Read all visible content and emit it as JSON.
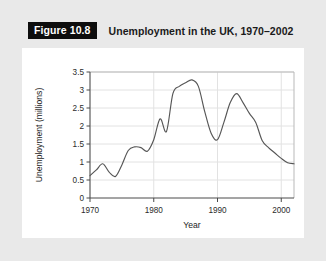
{
  "figure": {
    "badge_label": "Figure 10.8",
    "title": "Unemployment in the UK, 1970–2002"
  },
  "colors": {
    "page_background": "#e9e9e9",
    "card_background": "#ffffff",
    "badge_background": "#0d0d0d",
    "badge_text": "#ffffff",
    "title_text": "#1a1a1a",
    "line": "#565656",
    "axis": "#4a4a4a",
    "grid": "#e2e2e2",
    "frame": "#b9b9b9"
  },
  "chart_data": {
    "type": "line",
    "title": "Unemployment in the UK, 1970–2002",
    "xlabel": "Year",
    "ylabel": "Unemployment (millions)",
    "xlim": [
      1970,
      2002
    ],
    "ylim": [
      0,
      3.5
    ],
    "grid": true,
    "legend": "none",
    "xticks": [
      1970,
      1980,
      1990,
      2000
    ],
    "xtick_labels": [
      "1970",
      "1980",
      "1990",
      "2000"
    ],
    "yticks": [
      0,
      0.5,
      1,
      1.5,
      2,
      2.5,
      3,
      3.5
    ],
    "ytick_labels": [
      "0",
      "0.5",
      "1",
      "1.5",
      "2",
      "2.5",
      "3",
      "3.5"
    ],
    "series": [
      {
        "name": "Unemployment (millions)",
        "x": [
          1970,
          1971,
          1972,
          1973,
          1974,
          1975,
          1976,
          1977,
          1978,
          1979,
          1980,
          1981,
          1982,
          1983,
          1984,
          1985,
          1986,
          1987,
          1988,
          1989,
          1990,
          1991,
          1992,
          1993,
          1994,
          1995,
          1996,
          1997,
          1998,
          1999,
          2000,
          2001,
          2002
        ],
        "values": [
          0.62,
          0.78,
          0.95,
          0.72,
          0.6,
          0.92,
          1.32,
          1.42,
          1.4,
          1.3,
          1.62,
          2.2,
          1.85,
          2.9,
          3.1,
          3.2,
          3.28,
          3.1,
          2.4,
          1.8,
          1.62,
          2.1,
          2.65,
          2.9,
          2.65,
          2.35,
          2.1,
          1.6,
          1.4,
          1.25,
          1.1,
          0.98,
          0.95
        ]
      }
    ]
  }
}
